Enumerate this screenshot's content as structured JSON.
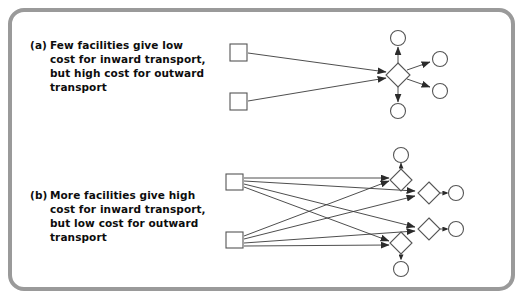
{
  "figure": {
    "frame_color": "#9a9a9a",
    "background": "#ffffff",
    "line_color": "#3a3a3a",
    "shape_stroke": "#555555"
  },
  "panels": [
    {
      "id": "a",
      "tag": "(a)",
      "caption_lines": [
        "Few facilities give low",
        "cost for inward transport,",
        "but high cost for outward",
        "transport"
      ],
      "caption_text": "Few facilities give low cost for inward transport, but high cost for outward transport",
      "source_count": 2,
      "facility_count": 1,
      "customer_count": 4,
      "inward_links": 2,
      "outward_links": 4
    },
    {
      "id": "b",
      "tag": "(b)",
      "caption_lines": [
        "More facilities give high",
        "cost for inward transport,",
        "but low cost for outward",
        "transport"
      ],
      "caption_text": "More facilities give high cost for inward transport, but low cost for outward transport",
      "source_count": 2,
      "facility_count": 4,
      "customer_count": 4,
      "inward_links": 8,
      "outward_links": 4
    }
  ],
  "legend_semantics": {
    "square": "source / supplier",
    "diamond": "facility / warehouse",
    "circle": "customer / demand point",
    "solid_arrow": "inward transport link",
    "dashed_arrow": "outward transport link"
  }
}
